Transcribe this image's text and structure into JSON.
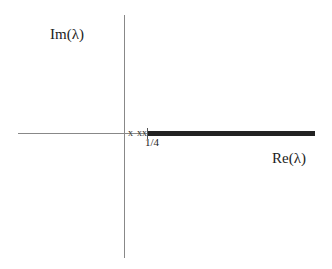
{
  "diagram": {
    "type": "complex-plane-spectrum",
    "axes": {
      "vertical_label": "Im(λ)",
      "horizontal_label": "Re(λ)"
    },
    "tick_label": "1/4",
    "eigenvalue_marks": "x  xx",
    "continuous_spectrum": {
      "description": "thick line on real axis from 1/4 to +infinity",
      "start": "1/4"
    },
    "colors": {
      "axis": "#888888",
      "spectrum": "#222222",
      "text": "#222222"
    }
  }
}
